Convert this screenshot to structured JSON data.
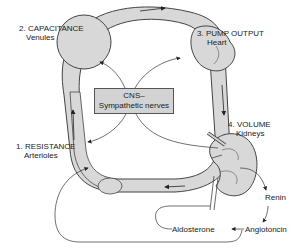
{
  "diagram": {
    "nodes": {
      "capacitance": {
        "title": "2. CAPACITANCE",
        "subtitle": "Venules"
      },
      "pump": {
        "title": "3. PUMP OUTPUT",
        "subtitle": "Heart"
      },
      "resistance": {
        "title": "1. RESISTANCE",
        "subtitle": "Arterioles"
      },
      "volume": {
        "title": "4. VOLUME",
        "subtitle": "Kidneys"
      },
      "cns": {
        "line1": "CNS–",
        "line2": "Sympathetic nerves"
      }
    },
    "hormones": {
      "renin": "Renin",
      "angiotensin": "Angiotoncin",
      "aldosterone": "Aldosterone"
    },
    "colors": {
      "vessel_fill": "#d8d8d8",
      "vessel_stroke": "#444444",
      "box_fill": "#d3d3d3",
      "line": "#333333"
    }
  }
}
